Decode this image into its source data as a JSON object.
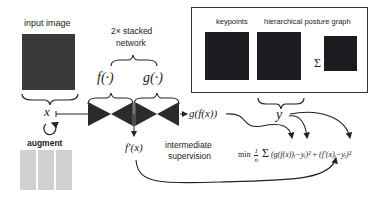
{
  "input": {
    "label": "input image",
    "variable": "x",
    "augment_label": "augment"
  },
  "network": {
    "title_line1": "2× stacked",
    "title_line2": "network",
    "f_label": "f(·)",
    "g_label": "g(·)",
    "output_final": "g(f(x))",
    "output_intermediate": "f′(x)"
  },
  "targets": {
    "keypoints_label": "keypoints",
    "graph_label": "hierarchical posture graph",
    "sum_symbol": "Σ",
    "variable": "y"
  },
  "supervision": {
    "line1": "intermediate",
    "line2": "supervision"
  },
  "loss": {
    "min": "min",
    "frac_num": "1",
    "frac_den": "n",
    "sum": "Σ",
    "sum_top": "n",
    "sum_bottom": "i",
    "term1": "(g(f(x))ᵢ−yᵢ)²",
    "plus": "+",
    "term2": "(f′(x)ᵢ−yᵢ)²"
  },
  "colors": {
    "ink": "#222222",
    "network": "#2b2b2b",
    "image_bg": "#1a1c1f"
  }
}
